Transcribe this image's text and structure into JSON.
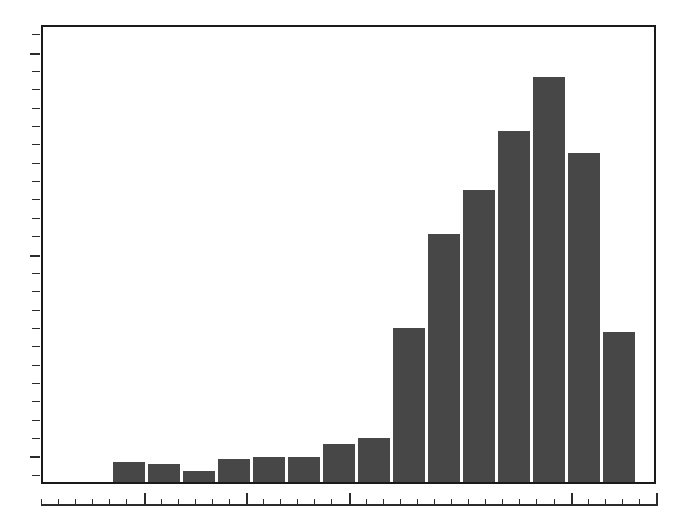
{
  "chart_data": {
    "type": "bar",
    "title": "",
    "subtitle": "",
    "xlabel": "",
    "ylabel": "",
    "legend": [],
    "grid": false,
    "legend_position": "none",
    "bar_color": "#474747",
    "axis_color": "#1a1a1a",
    "background": "#ffffff",
    "xlim": [
      0,
      20
    ],
    "ylim": [
      0,
      100
    ],
    "categories": [
      "1",
      "2",
      "3",
      "4",
      "5",
      "6",
      "7",
      "8",
      "9",
      "10",
      "11",
      "12",
      "13",
      "14",
      "15"
    ],
    "values": [
      4.3,
      3.9,
      2.4,
      5.0,
      5.5,
      5.5,
      8.4,
      9.6,
      33.8,
      54.4,
      64.1,
      77.2,
      89.0,
      72.3,
      33.0
    ],
    "tick_labels_x": [],
    "tick_labels_y": [],
    "n_bars": 15
  },
  "figure": {
    "width": 679,
    "height": 526,
    "plot": {
      "left": 41,
      "top": 25,
      "width": 615,
      "height": 459
    },
    "bar_geometry": {
      "first_left": 113,
      "bar_width": 32,
      "pitch": 35,
      "baseline_y": 482
    },
    "bar_tops_px": [
      464,
      466,
      473,
      461,
      459,
      445,
      445,
      432,
      424,
      329,
      233,
      192,
      157,
      106,
      177,
      332
    ]
  },
  "axes": {
    "y_axis": {
      "name": "y-axis-ticks",
      "x": 28,
      "top": 25,
      "height": 459,
      "minor_positions_pct": [
        2,
        6,
        10,
        14,
        18,
        22,
        26,
        30,
        34,
        38,
        42,
        46,
        50,
        54,
        58,
        62,
        66,
        70,
        74,
        78,
        82,
        86,
        90,
        94,
        98
      ],
      "major_positions_pct": [
        6,
        50,
        94
      ]
    },
    "x_axis": {
      "name": "x-axis-ticks",
      "left": 41,
      "y": 490,
      "width": 615,
      "minor_count": 36,
      "major_positions_px": [
        104,
        209,
        314,
        419,
        524,
        614
      ]
    }
  }
}
